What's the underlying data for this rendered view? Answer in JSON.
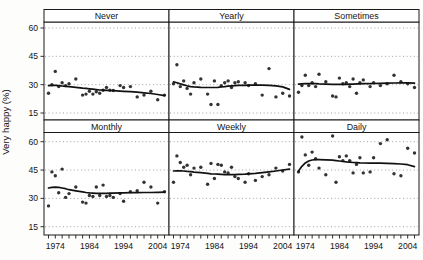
{
  "chart": {
    "y_axis_title": "Very happy (%)",
    "colors": {
      "panel_bg": "#ffffff",
      "page_bg": "#fdfdfc",
      "border": "#1a1a1a",
      "gridline": "#8f8f8f",
      "point": "#333333",
      "trend": "#111111",
      "text": "#141414"
    }
  },
  "chart_data": {
    "type": "scatter",
    "title": "",
    "xlabel": "",
    "ylabel": "Very happy (%)",
    "x_range": [
      1972,
      2006
    ],
    "x_minor_tick_step": 2,
    "x_tick_labels": [
      "1974",
      "1984",
      "1994",
      "2004"
    ],
    "y_ticks": [
      60,
      45,
      30,
      15
    ],
    "ylim": [
      11,
      64
    ],
    "grid": "horizontal-dotted",
    "legend": "none",
    "panel_grid": [
      [
        "Never",
        "Yearly",
        "Sometimes"
      ],
      [
        "Monthly",
        "Weekly",
        "Daily"
      ]
    ],
    "x": [
      1972,
      1973,
      1974,
      1975,
      1976,
      1977,
      1978,
      1980,
      1982,
      1983,
      1984,
      1985,
      1986,
      1987,
      1988,
      1989,
      1990,
      1991,
      1993,
      1994,
      1996,
      1998,
      2000,
      2002,
      2004,
      2006
    ],
    "panels": [
      {
        "label": "Never",
        "row": 0,
        "col": 0,
        "points": [
          25.5,
          30,
          37,
          29,
          31,
          29.5,
          30.5,
          33,
          24.5,
          25,
          26.5,
          25,
          26.3,
          25.5,
          27,
          28.5,
          27,
          26.9,
          29.5,
          28.5,
          29,
          23.5,
          24.5,
          26.5,
          22,
          24.5
        ],
        "trend": [
          29.5,
          29.6,
          29.6,
          29.5,
          29.3,
          29.1,
          28.9,
          28.6,
          28.2,
          28,
          27.8,
          27.6,
          27.4,
          27.2,
          27.1,
          27,
          26.9,
          26.8,
          26.6,
          26.5,
          26.3,
          26,
          25.7,
          25.3,
          24.8,
          24.2
        ]
      },
      {
        "label": "Yearly",
        "row": 0,
        "col": 1,
        "points": [
          30.5,
          40.5,
          29,
          32,
          28,
          25,
          31,
          33,
          25,
          19.5,
          32,
          19.5,
          29.5,
          31,
          32,
          28.5,
          31,
          31.5,
          31,
          29.5,
          30.5,
          24.5,
          38.5,
          23.5,
          25.5,
          24
        ],
        "trend": [
          31.5,
          31,
          30.4,
          29.9,
          29.4,
          29,
          28.8,
          28.6,
          28.5,
          28.5,
          28.5,
          28.6,
          28.8,
          29,
          29.2,
          29.4,
          29.5,
          29.6,
          29.6,
          29.7,
          29.7,
          29.7,
          29.6,
          29.4,
          28.8,
          27.5
        ]
      },
      {
        "label": "Sometimes",
        "row": 0,
        "col": 2,
        "points": [
          26,
          29.5,
          35,
          29.5,
          31,
          29,
          35.5,
          31.5,
          24,
          23.5,
          33.5,
          30.5,
          31,
          29,
          33,
          25.5,
          31,
          32.5,
          29,
          31,
          29.5,
          30.5,
          35,
          31.5,
          30.5,
          28.5
        ],
        "trend": [
          30.3,
          30.4,
          30.5,
          30.5,
          30.5,
          30.5,
          30.4,
          30.3,
          30.2,
          30.2,
          30.2,
          30.2,
          30.2,
          30.3,
          30.3,
          30.4,
          30.4,
          30.5,
          30.5,
          30.6,
          30.7,
          30.8,
          30.9,
          31,
          31,
          30.8
        ]
      },
      {
        "label": "Monthly",
        "row": 1,
        "col": 0,
        "points": [
          26,
          44,
          42,
          33,
          45.5,
          30.5,
          32.5,
          36,
          28,
          27.5,
          31.5,
          31,
          36,
          31.5,
          37,
          31,
          31.5,
          30.5,
          32.5,
          28.5,
          33.5,
          34,
          38.5,
          36,
          27.5,
          33.5
        ],
        "trend": [
          35.5,
          35.8,
          35.9,
          35.8,
          35.5,
          35.1,
          34.6,
          34,
          33.4,
          33.1,
          32.9,
          32.8,
          32.7,
          32.7,
          32.7,
          32.7,
          32.8,
          32.8,
          32.9,
          32.9,
          33,
          33,
          33.1,
          33.1,
          33.2,
          33.3
        ]
      },
      {
        "label": "Weekly",
        "row": 1,
        "col": 1,
        "points": [
          38.5,
          52.5,
          49,
          46.5,
          47.5,
          42.5,
          46,
          46.5,
          37.5,
          48.5,
          40.5,
          48,
          47.5,
          44,
          43.5,
          46.5,
          41.5,
          40.5,
          38.5,
          43,
          39.5,
          41.5,
          42.5,
          46,
          44.5,
          48
        ],
        "trend": [
          44.5,
          44.6,
          44.6,
          44.5,
          44.3,
          44.1,
          43.9,
          43.6,
          43.2,
          43,
          42.9,
          42.8,
          42.7,
          42.6,
          42.6,
          42.6,
          42.6,
          42.7,
          42.8,
          43,
          43.2,
          43.6,
          44,
          44.5,
          45,
          45.5
        ]
      },
      {
        "label": "Daily",
        "row": 1,
        "col": 2,
        "points": [
          44,
          62.5,
          53,
          47.5,
          54.5,
          51,
          46,
          42.5,
          63,
          38.5,
          52,
          50,
          52.5,
          50,
          43.5,
          48,
          51.5,
          43.5,
          44,
          51.5,
          59,
          61,
          43,
          42,
          56.5,
          54
        ],
        "trend": [
          44.5,
          47,
          48.8,
          49.8,
          50.3,
          50.5,
          50.5,
          50.4,
          50.2,
          50,
          49.8,
          49.5,
          49.3,
          49.2,
          49,
          48.9,
          48.8,
          48.7,
          48.6,
          48.6,
          48.6,
          48.5,
          48.4,
          48.2,
          47.8,
          46.8
        ]
      }
    ]
  }
}
